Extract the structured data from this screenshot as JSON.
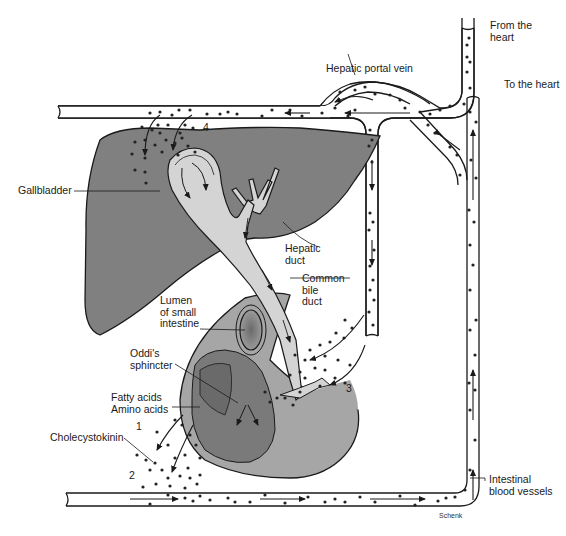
{
  "diagram": {
    "colors": {
      "liver": "#808080",
      "gallbladder_bile": "#d4d4d4",
      "intestine_outer": "#a6a6a6",
      "intestine_inner": "#7a7a7a",
      "lumen": "#8a8a8a",
      "vessel_fill": "#ffffff",
      "outline": "#1a1a1a",
      "dots": "#222222"
    },
    "labels": {
      "from_heart": "From the\nheart",
      "to_heart": "To the heart",
      "hepatic_portal_vein": "Hepatic portal vein",
      "gallbladder": "Gallbladder",
      "hepatic_duct": "Hepatic\nduct",
      "common_bile_duct": "Common\nbile\nduct",
      "lumen_small_intestine": "Lumen\nof small\nintestine",
      "oddis_sphincter": "Oddi's\nsphincter",
      "fatty_amino_acids": "Fatty acids\nAmino acids",
      "cholecystokinin": "Cholecystokinin",
      "intestinal_blood_vessels": "Intestinal\nblood vessels"
    },
    "steps": [
      "1",
      "2",
      "3",
      "4"
    ],
    "credit": "Schenk"
  }
}
